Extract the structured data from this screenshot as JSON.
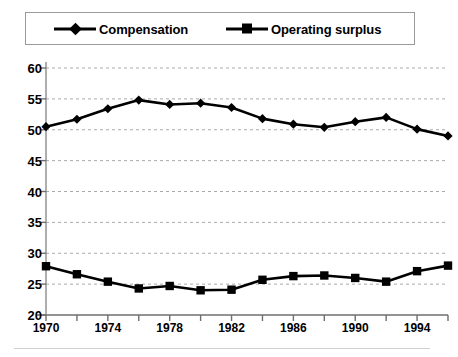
{
  "legend": {
    "entries": [
      {
        "label": "Compensation",
        "marker": "diamond-marker",
        "color": "#000000"
      },
      {
        "label": "Operating surplus",
        "marker": "square-marker",
        "color": "#000000"
      }
    ]
  },
  "axes": {
    "y_ticks": [
      "60",
      "55",
      "50",
      "45",
      "40",
      "35",
      "30",
      "25",
      "20"
    ],
    "x_ticks": [
      "1970",
      "1974",
      "1978",
      "1982",
      "1986",
      "1990",
      "1994"
    ]
  },
  "chart_data": {
    "type": "line",
    "title": "",
    "xlabel": "",
    "ylabel": "",
    "ylim": [
      20,
      60
    ],
    "xlim": [
      1970,
      1996
    ],
    "ytick_step": 5,
    "xtick_step": 2,
    "xlabel_step": 4,
    "grid": true,
    "grid_style": "dashed",
    "grid_color": "#aaaaaa",
    "legend_position": "top",
    "x": [
      1970,
      1972,
      1974,
      1976,
      1978,
      1980,
      1982,
      1984,
      1986,
      1988,
      1990,
      1992,
      1994,
      1996
    ],
    "series": [
      {
        "name": "Compensation",
        "marker": "diamond",
        "color": "#000000",
        "values": [
          50.5,
          51.7,
          53.4,
          54.8,
          54.1,
          54.3,
          53.6,
          51.8,
          50.9,
          50.4,
          51.3,
          52.0,
          50.1,
          49.0
        ]
      },
      {
        "name": "Operating surplus",
        "marker": "square",
        "color": "#000000",
        "values": [
          27.9,
          26.6,
          25.4,
          24.3,
          24.7,
          24.0,
          24.1,
          25.7,
          26.3,
          26.4,
          26.0,
          25.4,
          27.1,
          28.0
        ]
      }
    ]
  }
}
